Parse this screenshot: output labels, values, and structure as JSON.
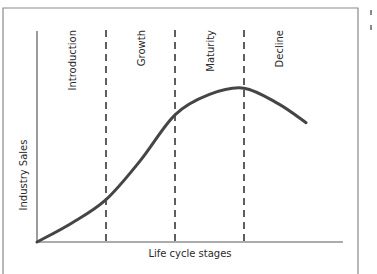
{
  "chart_data": {
    "type": "line",
    "title": "",
    "xlabel": "Life cycle stages",
    "ylabel": "Industry Sales",
    "stages": [
      "Introduction",
      "Growth",
      "Maturity",
      "Decline"
    ],
    "stage_boundaries": [
      1,
      2,
      3
    ],
    "x_range": [
      0,
      3.9
    ],
    "y_range": [
      0,
      1
    ],
    "series": [
      {
        "name": "Industry Sales",
        "x": [
          0,
          0.5,
          1.0,
          1.5,
          2.0,
          2.5,
          3.0,
          3.5,
          3.9
        ],
        "y": [
          0,
          0.12,
          0.27,
          0.52,
          0.81,
          0.94,
          0.98,
          0.88,
          0.76
        ]
      }
    ],
    "grid": false,
    "legend": "none"
  },
  "colors": {
    "curve": "#454545",
    "axes": "#5a5a5a",
    "frame": "#8a8a8a",
    "dashes": "#2a2a2a"
  }
}
